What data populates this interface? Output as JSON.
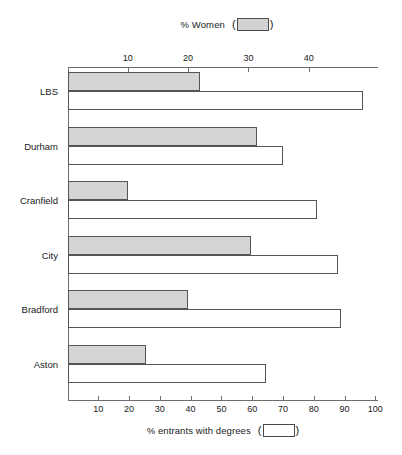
{
  "legend": {
    "women": {
      "label": "% Women",
      "open_paren": "(",
      "close_paren": ")",
      "swatch": "gray-filled-swatch",
      "color": "#d4d4d4"
    },
    "degrees": {
      "label": "% entrants with degrees",
      "open_paren": "(",
      "close_paren": ")",
      "swatch": "white-outline-swatch",
      "color": "#ffffff"
    }
  },
  "chart_data": {
    "type": "bar",
    "orientation": "horizontal",
    "title": "",
    "categories": [
      "LBS",
      "Durham",
      "Cranfield",
      "City",
      "Bradford",
      "Aston"
    ],
    "series": [
      {
        "name": "% Women",
        "axis": "top",
        "color": "#d4d4d4",
        "values": [
          22,
          31.5,
          10,
          30.5,
          20,
          13
        ]
      },
      {
        "name": "% entrants with degrees",
        "axis": "bottom",
        "color": "#ffffff",
        "values": [
          96,
          70,
          81,
          88,
          89,
          64.5
        ]
      }
    ],
    "top_axis": {
      "label": "% Women",
      "ticks": [
        10,
        20,
        30,
        40
      ],
      "tick_labels": [
        "10",
        "20",
        "30",
        "40"
      ],
      "range": [
        0,
        47
      ]
    },
    "bottom_axis": {
      "label": "% entrants with degrees",
      "ticks": [
        10,
        20,
        30,
        40,
        50,
        60,
        70,
        80,
        90,
        100
      ],
      "tick_labels": [
        "10",
        "20",
        "30",
        "40",
        "50",
        "60",
        "70",
        "80",
        "90",
        "100"
      ],
      "range": [
        0,
        104
      ]
    },
    "ylabel": "",
    "grid": false,
    "legend_position": "top and bottom, centered"
  }
}
